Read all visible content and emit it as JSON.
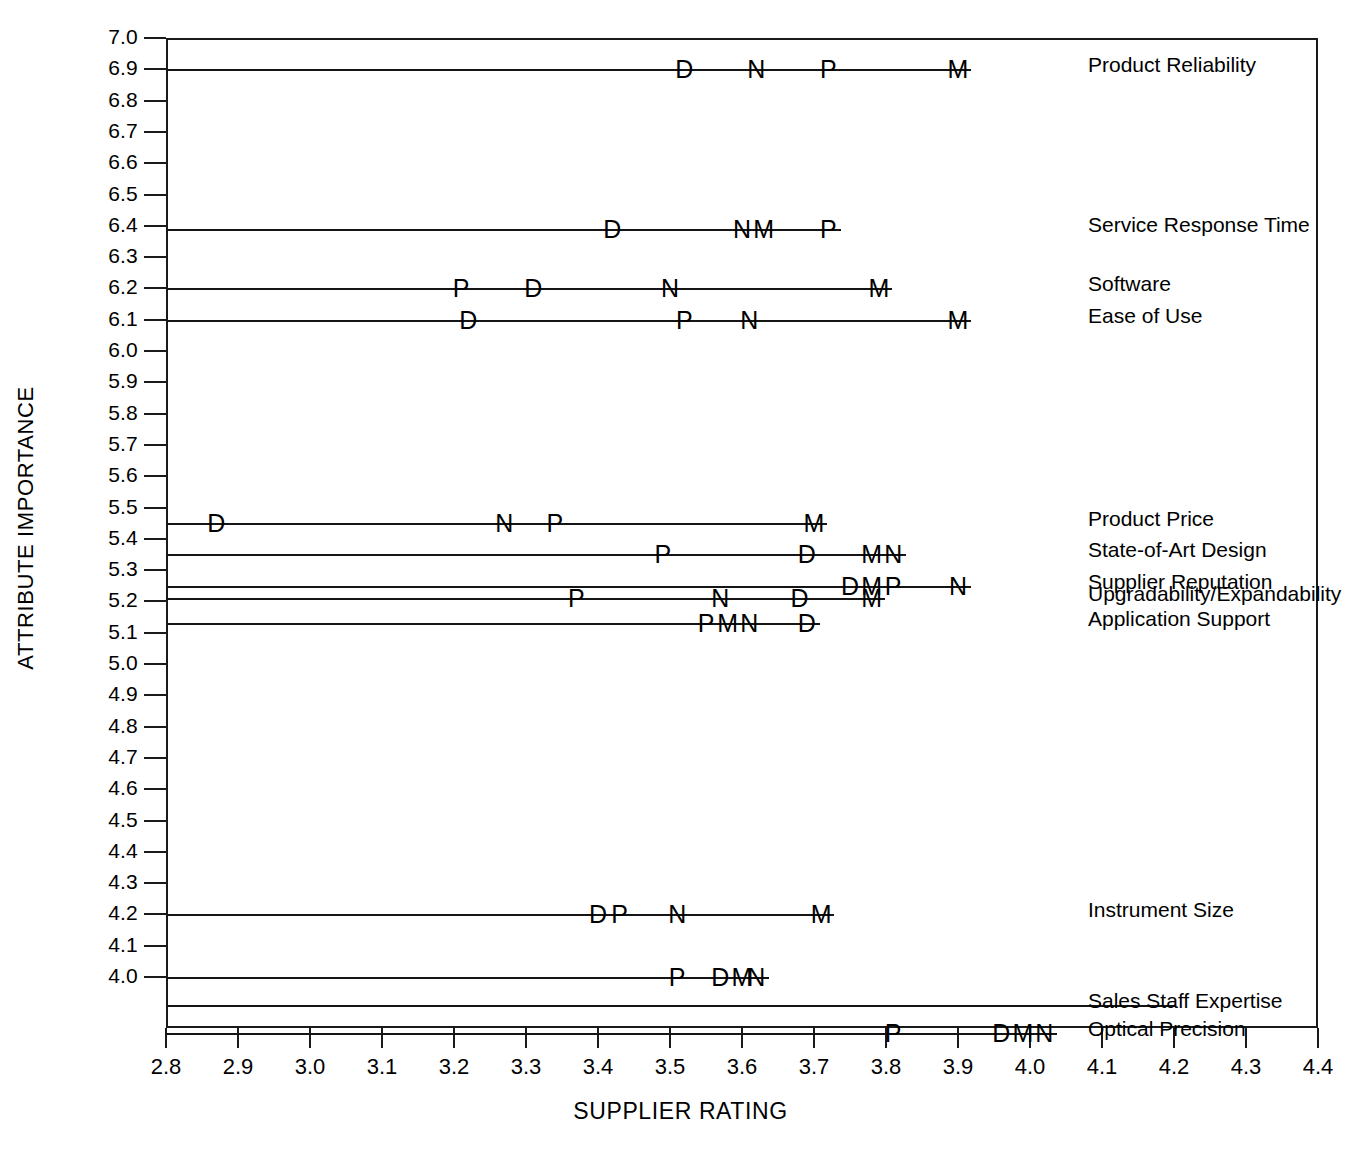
{
  "chart_data": {
    "type": "scatter",
    "title": "",
    "xlabel": "SUPPLIER RATING",
    "ylabel": "ATTRIBUTE IMPORTANCE",
    "xlim": [
      2.8,
      4.4
    ],
    "ylim": [
      3.78,
      7.0
    ],
    "grid": false,
    "legend": null,
    "xticks": [
      "2.8",
      "2.9",
      "3.0",
      "3.1",
      "3.2",
      "3.3",
      "3.4",
      "3.5",
      "3.6",
      "3.7",
      "3.8",
      "3.9",
      "4.0",
      "4.1",
      "4.2",
      "4.3",
      "4.4"
    ],
    "yticks": [
      "7.0",
      "6.9",
      "6.8",
      "6.7",
      "6.6",
      "6.5",
      "6.4",
      "6.3",
      "6.2",
      "6.1",
      "6.0",
      "5.9",
      "5.8",
      "5.7",
      "5.6",
      "5.5",
      "5.4",
      "5.3",
      "5.2",
      "5.1",
      "5.0",
      "4.9",
      "4.8",
      "4.7",
      "4.6",
      "4.5",
      "4.4",
      "4.3",
      "4.2",
      "4.1",
      "4.0"
    ],
    "supplier_codes": [
      "D",
      "N",
      "P",
      "M"
    ],
    "rows": [
      {
        "label": "Product Reliability",
        "importance": 6.9,
        "points": [
          {
            "code": "D",
            "rating": 3.52
          },
          {
            "code": "N",
            "rating": 3.62
          },
          {
            "code": "P",
            "rating": 3.72
          },
          {
            "code": "M",
            "rating": 3.9
          }
        ]
      },
      {
        "label": "Service Response Time",
        "importance": 6.39,
        "points": [
          {
            "code": "D",
            "rating": 3.42
          },
          {
            "code": "N",
            "rating": 3.6
          },
          {
            "code": "M",
            "rating": 3.63
          },
          {
            "code": "P",
            "rating": 3.72
          }
        ]
      },
      {
        "label": "Software",
        "importance": 6.2,
        "points": [
          {
            "code": "P",
            "rating": 3.21
          },
          {
            "code": "D",
            "rating": 3.31
          },
          {
            "code": "N",
            "rating": 3.5
          },
          {
            "code": "M",
            "rating": 3.79
          }
        ]
      },
      {
        "label": "Ease of Use",
        "importance": 6.1,
        "points": [
          {
            "code": "D",
            "rating": 3.22
          },
          {
            "code": "P",
            "rating": 3.52
          },
          {
            "code": "N",
            "rating": 3.61
          },
          {
            "code": "M",
            "rating": 3.9
          }
        ]
      },
      {
        "label": "Product Price",
        "importance": 5.45,
        "points": [
          {
            "code": "D",
            "rating": 2.87
          },
          {
            "code": "N",
            "rating": 3.27
          },
          {
            "code": "P",
            "rating": 3.34
          },
          {
            "code": "M",
            "rating": 3.7
          }
        ]
      },
      {
        "label": "State-of-Art Design",
        "importance": 5.35,
        "points": [
          {
            "code": "P",
            "rating": 3.49
          },
          {
            "code": "D",
            "rating": 3.69
          },
          {
            "code": "M",
            "rating": 3.78
          },
          {
            "code": "N",
            "rating": 3.81
          }
        ]
      },
      {
        "label": "Supplier Reputation",
        "importance": 5.25,
        "points": [
          {
            "code": "D",
            "rating": 3.75
          },
          {
            "code": "M",
            "rating": 3.78
          },
          {
            "code": "P",
            "rating": 3.81
          },
          {
            "code": "N",
            "rating": 3.9
          }
        ]
      },
      {
        "label": "Upgradability/Expandability",
        "importance": 5.21,
        "points": [
          {
            "code": "P",
            "rating": 3.37
          },
          {
            "code": "N",
            "rating": 3.57
          },
          {
            "code": "D",
            "rating": 3.68
          },
          {
            "code": "M",
            "rating": 3.78
          }
        ]
      },
      {
        "label": "Application Support",
        "importance": 5.13,
        "points": [
          {
            "code": "P",
            "rating": 3.55
          },
          {
            "code": "M",
            "rating": 3.58
          },
          {
            "code": "N",
            "rating": 3.61
          },
          {
            "code": "D",
            "rating": 3.69
          }
        ]
      },
      {
        "label": "Instrument Size",
        "importance": 4.2,
        "points": [
          {
            "code": "D",
            "rating": 3.4
          },
          {
            "code": "P",
            "rating": 3.43
          },
          {
            "code": "N",
            "rating": 3.51
          },
          {
            "code": "M",
            "rating": 3.71
          }
        ]
      },
      {
        "label": "",
        "importance": 4.0,
        "points": [
          {
            "code": "P",
            "rating": 3.51
          },
          {
            "code": "D",
            "rating": 3.57
          },
          {
            "code": "M",
            "rating": 3.6
          },
          {
            "code": "N",
            "rating": 3.62
          }
        ]
      },
      {
        "label": "Sales Staff Expertise",
        "importance": 3.91,
        "points": []
      },
      {
        "label": "Optical Precision",
        "importance": 3.82,
        "points": [
          {
            "code": "P",
            "rating": 3.81
          },
          {
            "code": "D",
            "rating": 3.96
          },
          {
            "code": "M",
            "rating": 3.99
          },
          {
            "code": "N",
            "rating": 4.02
          }
        ]
      }
    ]
  }
}
